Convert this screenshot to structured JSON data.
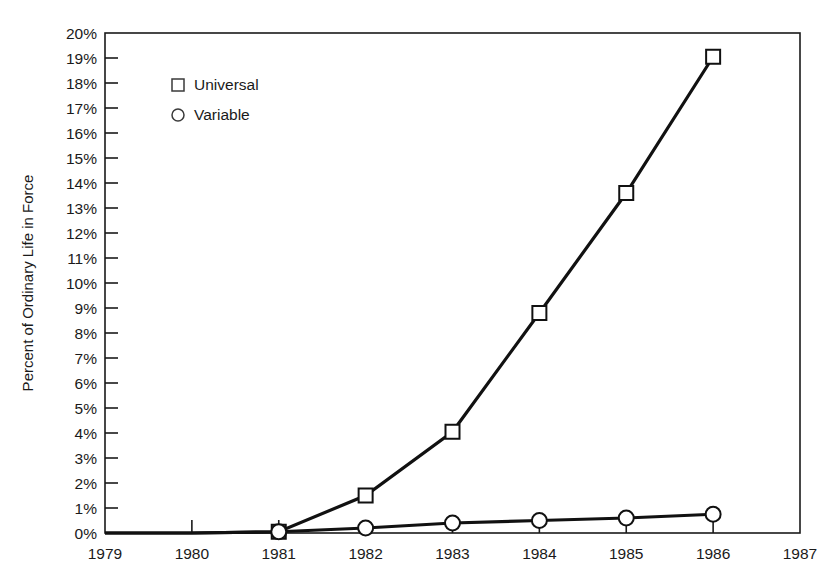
{
  "chart_data": {
    "type": "line",
    "title": "",
    "xlabel": "",
    "ylabel": "Percent of Ordinary Life in Force",
    "x": [
      1979,
      1980,
      1981,
      1982,
      1983,
      1984,
      1985,
      1986
    ],
    "xtick_labels": [
      "1979",
      "1980",
      "1981",
      "1982",
      "1983",
      "1984",
      "1985",
      "1986",
      "1987"
    ],
    "xtick_values": [
      1979,
      1980,
      1981,
      1982,
      1983,
      1984,
      1985,
      1986,
      1987
    ],
    "ytick_labels": [
      "0%",
      "1%",
      "2%",
      "3%",
      "4%",
      "5%",
      "6%",
      "7%",
      "8%",
      "9%",
      "10%",
      "11%",
      "12%",
      "13%",
      "14%",
      "15%",
      "16%",
      "17%",
      "18%",
      "19%",
      "20%"
    ],
    "ytick_values": [
      0,
      1,
      2,
      3,
      4,
      5,
      6,
      7,
      8,
      9,
      10,
      11,
      12,
      13,
      14,
      15,
      16,
      17,
      18,
      19,
      20
    ],
    "xlim": [
      1979,
      1987
    ],
    "ylim": [
      0,
      20
    ],
    "grid": false,
    "legend_position": "upper-left-inside",
    "series": [
      {
        "name": "Universal",
        "marker": "square",
        "values": [
          0,
          0,
          0.05,
          1.5,
          4.05,
          8.8,
          13.6,
          19.05
        ]
      },
      {
        "name": "Variable",
        "marker": "circle",
        "values": [
          0,
          0,
          0.05,
          0.2,
          0.4,
          0.5,
          0.6,
          0.75
        ]
      }
    ]
  },
  "legend": {
    "entries": [
      {
        "label": "Universal",
        "marker": "square"
      },
      {
        "label": "Variable",
        "marker": "circle"
      }
    ]
  },
  "colors": {
    "line": "#111111",
    "marker_fill": "#ffffff",
    "axis": "#1a1a1a",
    "background": "#ffffff"
  }
}
